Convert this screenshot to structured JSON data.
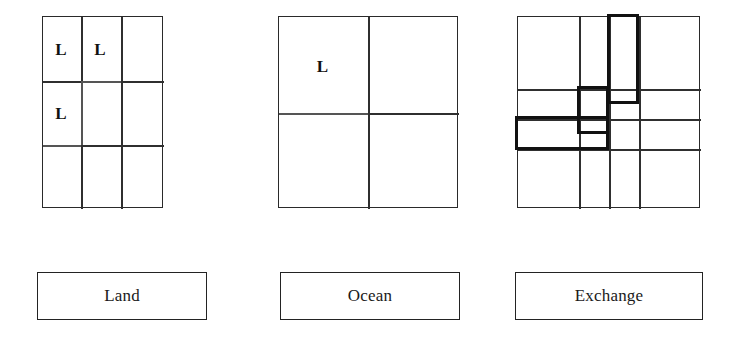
{
  "figure": {
    "title": "",
    "panel_count": 3
  },
  "panels": [
    {
      "id": "land",
      "legend_label": "Land",
      "grid": {
        "rows": 3,
        "cols": 3
      },
      "markers": [
        {
          "label": "L",
          "row": 1,
          "col": 1
        },
        {
          "label": "L",
          "row": 1,
          "col": 2
        },
        {
          "label": "L",
          "row": 2,
          "col": 1
        }
      ],
      "highlight_regions": []
    },
    {
      "id": "ocean",
      "legend_label": "Ocean",
      "grid": {
        "rows": 2,
        "cols": 2
      },
      "markers": [
        {
          "label": "L",
          "row": 1,
          "col": 1
        }
      ],
      "highlight_regions": []
    },
    {
      "id": "exchange",
      "legend_label": "Exchange",
      "grid": {
        "rows": 4,
        "cols": 4
      },
      "markers": [],
      "highlight_regions": [
        {
          "name": "tall-rect-col3-rows1-2"
        },
        {
          "name": "square-col2-row2"
        },
        {
          "name": "wide-rect-cols1-2-row3"
        }
      ]
    }
  ],
  "colors": {
    "grid_line": "#2f2f2f",
    "grid_line_soft": "#555555",
    "highlight_stroke": "#111111",
    "text": "#1a1a1a",
    "background": "#ffffff"
  }
}
